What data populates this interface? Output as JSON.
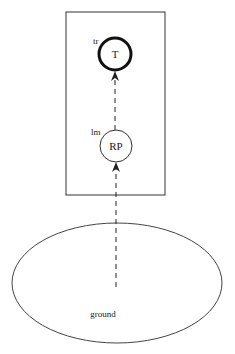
{
  "diagram": {
    "container": {
      "label": ""
    },
    "nodes": [
      {
        "id": "T",
        "label": "T",
        "tag": "tr",
        "style": "bold-circle"
      },
      {
        "id": "RP",
        "label": "RP",
        "tag": "lm",
        "style": "thin-circle"
      },
      {
        "id": "ground",
        "label": "ground",
        "style": "ellipse"
      }
    ],
    "edges": [
      {
        "from": "ground",
        "to": "RP",
        "style": "dashed-arrow"
      },
      {
        "from": "RP",
        "to": "T",
        "style": "dashed-arrow"
      }
    ],
    "colors": {
      "stroke": "#222222",
      "background": "#ffffff"
    }
  }
}
